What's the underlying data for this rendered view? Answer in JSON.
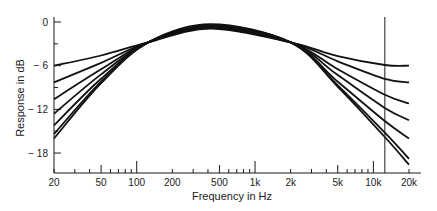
{
  "chart_data": {
    "type": "line",
    "title": "",
    "xlabel": "Frequency in Hz",
    "ylabel": "Response in dB",
    "xscale": "log",
    "xlim": [
      20,
      20000
    ],
    "ylim": [
      -20,
      0
    ],
    "grid": false,
    "legend": null,
    "x_ticks": [
      {
        "value": 20,
        "label": "20"
      },
      {
        "value": 50,
        "label": "50"
      },
      {
        "value": 100,
        "label": "100"
      },
      {
        "value": 200,
        "label": "200"
      },
      {
        "value": 500,
        "label": "500"
      },
      {
        "value": 1000,
        "label": "1k"
      },
      {
        "value": 2000,
        "label": "2k"
      },
      {
        "value": 5000,
        "label": "5k"
      },
      {
        "value": 10000,
        "label": "10k"
      },
      {
        "value": 20000,
        "label": "20k"
      }
    ],
    "y_ticks": [
      {
        "value": 0,
        "label": "0"
      },
      {
        "value": -6,
        "label": "-6"
      },
      {
        "value": -12,
        "label": "-12"
      },
      {
        "value": -18,
        "label": "-18"
      }
    ],
    "annotations": [
      {
        "type": "vertical-line",
        "x": 12500,
        "description": "reference marker line near 12.5 kHz"
      }
    ],
    "x": [
      20,
      50,
      125,
      420,
      2000,
      5000,
      12500,
      20000
    ],
    "series": [
      {
        "name": "curve-1",
        "values": [
          -6.0,
          -4.6,
          -2.8,
          -0.9,
          -2.8,
          -4.7,
          -5.9,
          -6.0
        ]
      },
      {
        "name": "curve-2",
        "values": [
          -8.3,
          -5.6,
          -2.8,
          -0.8,
          -2.8,
          -5.4,
          -7.8,
          -8.3
        ]
      },
      {
        "name": "curve-3",
        "values": [
          -10.6,
          -6.5,
          -2.8,
          -0.7,
          -2.8,
          -6.5,
          -10.0,
          -11.2
        ]
      },
      {
        "name": "curve-4",
        "values": [
          -12.6,
          -7.2,
          -2.8,
          -0.6,
          -2.8,
          -7.3,
          -11.8,
          -13.5
        ]
      },
      {
        "name": "curve-5",
        "values": [
          -14.2,
          -7.8,
          -2.8,
          -0.5,
          -2.8,
          -8.2,
          -13.6,
          -16.0
        ]
      },
      {
        "name": "curve-6",
        "values": [
          -15.4,
          -8.2,
          -2.8,
          -0.4,
          -2.8,
          -8.7,
          -15.2,
          -18.8
        ]
      },
      {
        "name": "curve-7",
        "values": [
          -16.0,
          -8.4,
          -2.8,
          -0.3,
          -2.8,
          -8.9,
          -15.8,
          -19.6
        ]
      }
    ]
  }
}
